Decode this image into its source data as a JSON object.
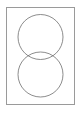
{
  "canvas": {
    "width": 82,
    "height": 113,
    "background_color": "#ffffff"
  },
  "frame": {
    "name": "page-frame",
    "x": 6,
    "y": 7,
    "width": 69,
    "height": 98,
    "fill_color": "#ffffff",
    "border_color": "#9a9a9a",
    "border_width": 1
  },
  "diagram": {
    "type": "venn-two-circles",
    "orientation": "vertical",
    "stroke_color": "#6e6e6e",
    "stroke_width": 0.8,
    "fill": "none",
    "circles": [
      {
        "name": "top-circle",
        "cx": 40.5,
        "cy": 37,
        "r": 22.5
      },
      {
        "name": "bottom-circle",
        "cx": 40.5,
        "cy": 74.5,
        "r": 22.5
      }
    ],
    "intersection": {
      "name": "lens-overlap",
      "top_y": 52,
      "bottom_y": 59.5,
      "left_x": 20.5,
      "right_x": 60.5
    }
  }
}
